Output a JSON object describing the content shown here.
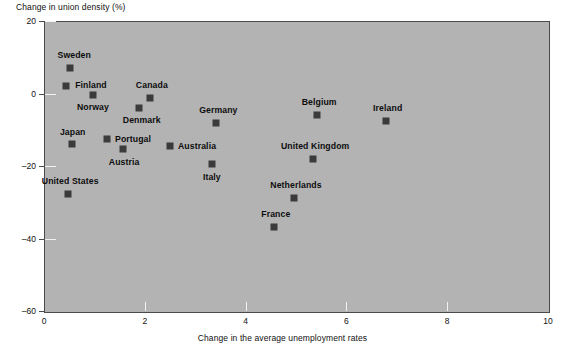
{
  "chart_data": {
    "type": "scatter",
    "title": "",
    "ylabel": "Change in union density (%)",
    "xlabel": "Change in the average unemployment rates",
    "xlim": [
      0,
      10
    ],
    "ylim": [
      -60,
      20
    ],
    "xticks": [
      "0",
      "2",
      "4",
      "6",
      "8",
      "10"
    ],
    "yticks": [
      "20",
      "0",
      "–20",
      "–40",
      "–60"
    ],
    "xtick_values": [
      0,
      2,
      4,
      6,
      8,
      10
    ],
    "ytick_values": [
      20,
      0,
      -20,
      -40,
      -60
    ],
    "grid": false,
    "legend": "none",
    "plot_background": "#b3b3b3",
    "marker_color": "#3b3b3b",
    "points": [
      {
        "label": "Sweden",
        "x": 0.52,
        "y": 7.0,
        "label_dx": 4,
        "label_dy": -14,
        "anchor": "center"
      },
      {
        "label": "Finland",
        "x": 0.44,
        "y": 2.0,
        "label_dx": 9,
        "label_dy": -2,
        "anchor": "left"
      },
      {
        "label": "Norway",
        "x": 0.97,
        "y": -0.5,
        "label_dx": 0,
        "label_dy": 11,
        "anchor": "center"
      },
      {
        "label": "Canada",
        "x": 2.1,
        "y": -1.2,
        "label_dx": 2,
        "label_dy": -14,
        "anchor": "center"
      },
      {
        "label": "Denmark",
        "x": 1.88,
        "y": -4.0,
        "label_dx": 3,
        "label_dy": 11,
        "anchor": "center"
      },
      {
        "label": "Germany",
        "x": 3.42,
        "y": -8.0,
        "label_dx": 2,
        "label_dy": -14,
        "anchor": "center"
      },
      {
        "label": "Belgium",
        "x": 5.42,
        "y": -6.0,
        "label_dx": 2,
        "label_dy": -14,
        "anchor": "center"
      },
      {
        "label": "Ireland",
        "x": 6.78,
        "y": -7.5,
        "label_dx": 2,
        "label_dy": -14,
        "anchor": "center"
      },
      {
        "label": "Japan",
        "x": 0.55,
        "y": -13.8,
        "label_dx": 1,
        "label_dy": -13,
        "anchor": "center"
      },
      {
        "label": "Portugal",
        "x": 1.25,
        "y": -12.5,
        "label_dx": 8,
        "label_dy": -1,
        "anchor": "left"
      },
      {
        "label": "Austria",
        "x": 1.57,
        "y": -15.3,
        "label_dx": 1,
        "label_dy": 12,
        "anchor": "center"
      },
      {
        "label": "Australia",
        "x": 2.5,
        "y": -14.4,
        "label_dx": 8,
        "label_dy": -1,
        "anchor": "left"
      },
      {
        "label": "Italy",
        "x": 3.33,
        "y": -19.4,
        "label_dx": 0,
        "label_dy": 12,
        "anchor": "center"
      },
      {
        "label": "United Kingdom",
        "x": 5.34,
        "y": -18.2,
        "label_dx": 2,
        "label_dy": -14,
        "anchor": "center"
      },
      {
        "label": "United States",
        "x": 0.48,
        "y": -27.6,
        "label_dx": 2,
        "label_dy": -14,
        "anchor": "center"
      },
      {
        "label": "Netherlands",
        "x": 4.96,
        "y": -28.8,
        "label_dx": 2,
        "label_dy": -14,
        "anchor": "center"
      },
      {
        "label": "France",
        "x": 4.56,
        "y": -36.8,
        "label_dx": 2,
        "label_dy": -14,
        "anchor": "center"
      }
    ]
  }
}
